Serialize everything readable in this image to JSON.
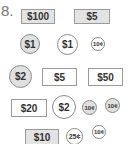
{
  "problem": {
    "number_label": "8."
  },
  "items": [
    {
      "id": "bill-100",
      "type": "bill",
      "label": "$100",
      "fill": "#e3e3e3"
    },
    {
      "id": "bill-5-gray",
      "type": "bill",
      "label": "$5",
      "fill": "#e3e3e3"
    },
    {
      "id": "coin-1-gray",
      "type": "coin",
      "label": "$1",
      "fill": "#e0e0e0"
    },
    {
      "id": "coin-1-white",
      "type": "coin",
      "label": "$1",
      "fill": "#ffffff"
    },
    {
      "id": "coin-10c-1",
      "type": "coin",
      "label": "10¢",
      "fill": "#ffffff"
    },
    {
      "id": "coin-2-gray",
      "type": "coin",
      "label": "$2",
      "fill": "#e0e0e0"
    },
    {
      "id": "bill-5-white",
      "type": "bill",
      "label": "$5",
      "fill": "#ffffff"
    },
    {
      "id": "bill-50",
      "type": "bill",
      "label": "$50",
      "fill": "#ffffff"
    },
    {
      "id": "bill-20",
      "type": "bill",
      "label": "$20",
      "fill": "#ffffff"
    },
    {
      "id": "coin-2-white",
      "type": "coin",
      "label": "$2",
      "fill": "#ffffff"
    },
    {
      "id": "coin-10c-2",
      "type": "coin",
      "label": "10¢",
      "fill": "#e0e0e0"
    },
    {
      "id": "coin-10c-3",
      "type": "coin",
      "label": "10¢",
      "fill": "#e0e0e0"
    },
    {
      "id": "bill-10",
      "type": "bill",
      "label": "$10",
      "fill": "#e3e3e3"
    },
    {
      "id": "coin-25c",
      "type": "coin",
      "label": "25¢",
      "fill": "#ffffff"
    },
    {
      "id": "coin-10c-4",
      "type": "coin",
      "label": "10¢",
      "fill": "#ffffff"
    }
  ]
}
